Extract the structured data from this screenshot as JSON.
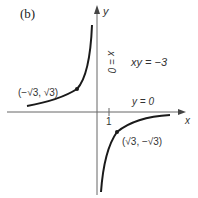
{
  "figure": {
    "panel_label": "(b)",
    "equation": "xy = −3",
    "axes": {
      "x_label": "x",
      "y_label": "y",
      "x_tick": "1"
    },
    "asymptotes": {
      "vertical": "x = 0",
      "horizontal": "y = 0"
    },
    "points": [
      {
        "label": "(−√3, √3)",
        "x": "-sqrt3",
        "y": "sqrt3"
      },
      {
        "label": "(√3, −√3)",
        "x": "sqrt3",
        "y": "-sqrt3"
      }
    ]
  },
  "colors": {
    "curve": "#1a1a1a",
    "axis": "#555555",
    "text": "#333333"
  }
}
